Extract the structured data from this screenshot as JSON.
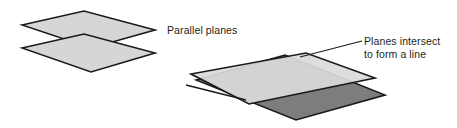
{
  "figure": {
    "background_color": "#ffffff",
    "labels": {
      "parallel_planes": "Parallel planes",
      "intersect_line_1": "Planes intersect",
      "intersect_line_2": "to form a line"
    },
    "colors": {
      "plane_light": "#d6d6d6",
      "plane_light_alt": "#dadada",
      "plane_dark": "#7d7d7d",
      "outline": "#1a1a1a",
      "text": "#231f20",
      "leader_line": "#1a1a1a"
    },
    "parallel_group": {
      "name": "parallel-planes-group",
      "upper_plane": {
        "name": "upper-parallel-plane",
        "fill": "#d6d6d6",
        "points": "22,25 84,11 155,30 91,48"
      },
      "lower_plane": {
        "name": "lower-parallel-plane",
        "fill": "#d6d6d6",
        "points": "22,48 84,34 155,53 91,72"
      }
    },
    "intersect_group": {
      "name": "intersecting-planes-group",
      "back_plane": {
        "name": "back-intersecting-plane",
        "fill": "#7d7d7d",
        "points": "196,80 285,55 385,95 296,120"
      },
      "front_plane": {
        "name": "front-intersecting-plane",
        "fill": "#dadada",
        "points": "191,74 306,53 375,78 249,104"
      },
      "intersection_line": {
        "name": "intersection-line",
        "x1": 186,
        "y1": 85,
        "x2": 246,
        "y2": 100
      }
    },
    "leader_line": {
      "name": "intersect-leader-line",
      "x1": 300,
      "y1": 57,
      "x2": 362,
      "y2": 41
    }
  }
}
